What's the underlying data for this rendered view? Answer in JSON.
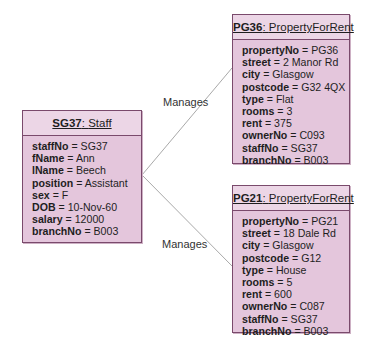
{
  "diagram": {
    "staff": {
      "id": "SG37",
      "class": "Staff",
      "attributes": [
        {
          "name": "staffNo",
          "value": "SG37"
        },
        {
          "name": "fName",
          "value": "Ann"
        },
        {
          "name": "lName",
          "value": "Beech"
        },
        {
          "name": "position",
          "value": "Assistant"
        },
        {
          "name": "sex",
          "value": "F"
        },
        {
          "name": "DOB",
          "value": "10-Nov-60"
        },
        {
          "name": "salary",
          "value": "12000"
        },
        {
          "name": "branchNo",
          "value": "B003"
        }
      ]
    },
    "properties": [
      {
        "id": "PG36",
        "class": "PropertyForRent",
        "attributes": [
          {
            "name": "propertyNo",
            "value": "PG36"
          },
          {
            "name": "street",
            "value": "2 Manor Rd"
          },
          {
            "name": "city",
            "value": "Glasgow"
          },
          {
            "name": "postcode",
            "value": "G32 4QX"
          },
          {
            "name": "type",
            "value": "Flat"
          },
          {
            "name": "rooms",
            "value": "3"
          },
          {
            "name": "rent",
            "value": "375"
          },
          {
            "name": "ownerNo",
            "value": "C093"
          },
          {
            "name": "staffNo",
            "value": "SG37"
          },
          {
            "name": "branchNo",
            "value": "B003"
          }
        ]
      },
      {
        "id": "PG21",
        "class": "PropertyForRent",
        "attributes": [
          {
            "name": "propertyNo",
            "value": "PG21"
          },
          {
            "name": "street",
            "value": "18 Dale Rd"
          },
          {
            "name": "city",
            "value": "Glasgow"
          },
          {
            "name": "postcode",
            "value": "G12"
          },
          {
            "name": "type",
            "value": "House"
          },
          {
            "name": "rooms",
            "value": "5"
          },
          {
            "name": "rent",
            "value": "600"
          },
          {
            "name": "ownerNo",
            "value": "C087"
          },
          {
            "name": "staffNo",
            "value": "SG37"
          },
          {
            "name": "branchNo",
            "value": "B003"
          }
        ]
      }
    ],
    "links": [
      {
        "label": "Manages",
        "from": "SG37",
        "to": "PG36"
      },
      {
        "label": "Manages",
        "from": "SG37",
        "to": "PG21"
      }
    ],
    "colors": {
      "box_fill": "#e4c6dc",
      "box_border": "#7a4a6c",
      "line": "#a9a9a9"
    }
  }
}
